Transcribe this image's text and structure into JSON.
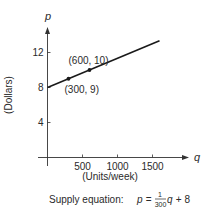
{
  "chart_data": {
    "type": "line",
    "title": "",
    "xlabel": "(Units/week)",
    "ylabel": "(Dollars)",
    "x_axis_symbol": "q",
    "y_axis_symbol": "p",
    "xlim": [
      0,
      1600
    ],
    "ylim": [
      0,
      13.5
    ],
    "x_ticks": [
      500,
      1000,
      1500
    ],
    "x_tick_labels": [
      "500",
      "1000",
      "1500"
    ],
    "y_ticks": [
      4,
      8,
      12
    ],
    "y_tick_labels": [
      "4",
      "8",
      "12"
    ],
    "grid": false,
    "series": [
      {
        "name": "Supply",
        "equation": "p = (1/300)q + 8",
        "x": [
          0,
          1600
        ],
        "y": [
          8,
          13.333
        ]
      }
    ],
    "points": [
      {
        "x": 300,
        "y": 9,
        "label": "(300, 9)"
      },
      {
        "x": 600,
        "y": 10,
        "label": "(600, 10)"
      }
    ],
    "caption": {
      "prefix": "Supply equation: ",
      "var_p": "p",
      "equals": " = ",
      "numerator": "1",
      "denominator": "300",
      "var_q": "q",
      "suffix": " + 8"
    },
    "colors": {
      "axis": "#333333",
      "line": "#1a1a1a",
      "text": "#2a2a2a"
    }
  }
}
